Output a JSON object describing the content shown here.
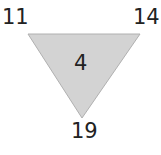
{
  "puzzle": {
    "shape": "inverted-triangle",
    "corners": {
      "top_left": "11",
      "top_right": "14",
      "bottom": "19"
    },
    "center": "4",
    "colors": {
      "fill": "#d3d3d3",
      "stroke": "#b0b0b0",
      "text": "#222222"
    }
  }
}
